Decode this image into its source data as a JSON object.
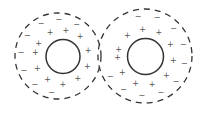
{
  "spheres": [
    {
      "name": "left",
      "inner_signs": [
        "+",
        "+",
        "+",
        "+",
        "+",
        "+",
        "+",
        "+",
        "+",
        "+",
        "+"
      ],
      "outer_signs": [
        "−",
        "−",
        "−",
        "−",
        "−",
        "−",
        "−",
        "−"
      ]
    },
    {
      "name": "right",
      "inner_signs": [
        "+",
        "+",
        "+",
        "+",
        "+",
        "+",
        "+",
        "+",
        "+",
        "+",
        "+"
      ],
      "outer_signs": [
        "−",
        "−",
        "−",
        "−",
        "−",
        "−",
        "−",
        "−",
        "−",
        "−"
      ]
    }
  ],
  "colors": {
    "stroke": "#333333",
    "sign": "#555555",
    "background": "#ffffff"
  }
}
